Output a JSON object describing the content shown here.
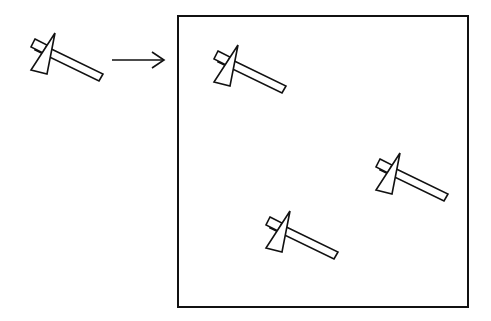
{
  "diagram": {
    "colors": {
      "stroke": "#111111",
      "background": "#ffffff",
      "fill": "#ffffff"
    },
    "source_figure": {
      "x": 25,
      "y": 33
    },
    "arrow": {
      "x1": 112,
      "y1": 60,
      "x2": 164,
      "y2": 60
    },
    "frame": {
      "x": 178,
      "y": 16,
      "width": 290,
      "height": 291
    },
    "copies": [
      {
        "x": 208,
        "y": 45
      },
      {
        "x": 370,
        "y": 153
      },
      {
        "x": 260,
        "y": 211
      }
    ]
  }
}
